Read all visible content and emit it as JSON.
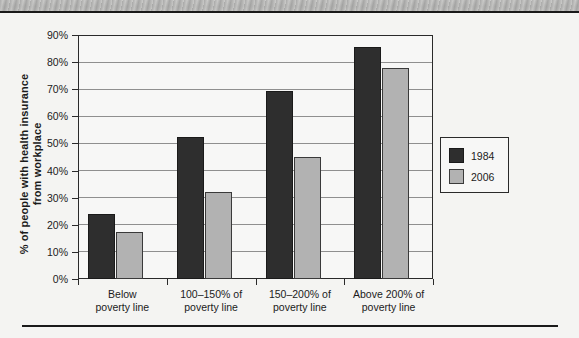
{
  "chart_data": {
    "type": "bar",
    "title": "",
    "xlabel": "",
    "ylabel": "% of people with health insurance from workplace",
    "ylabel_lines": [
      "% of people with health insurance",
      "from workplace"
    ],
    "categories": [
      "Below poverty line",
      "100–150% of poverty line",
      "150–200% of poverty line",
      "Above 200% of poverty line"
    ],
    "category_lines": [
      [
        "Below",
        "poverty line"
      ],
      [
        "100–150% of",
        "poverty line"
      ],
      [
        "150–200% of",
        "poverty line"
      ],
      [
        "Above 200% of",
        "poverty line"
      ]
    ],
    "series": [
      {
        "name": "1984",
        "color": "#2e2e2e",
        "values": [
          24,
          52.5,
          69.5,
          85.5
        ]
      },
      {
        "name": "2006",
        "color": "#b2b2b2",
        "values": [
          17.5,
          32,
          45,
          78
        ]
      }
    ],
    "ylim": [
      0,
      90
    ],
    "ytick_labels": [
      "90%",
      "80%",
      "70%",
      "60%",
      "50%",
      "40%",
      "30%",
      "20%",
      "10%",
      "0%"
    ],
    "ytick_values": [
      90,
      80,
      70,
      60,
      50,
      40,
      30,
      20,
      10,
      0
    ],
    "grid": true,
    "legend_position": "right"
  },
  "legend": {
    "entries": [
      {
        "label": "1984"
      },
      {
        "label": "2006"
      }
    ]
  }
}
